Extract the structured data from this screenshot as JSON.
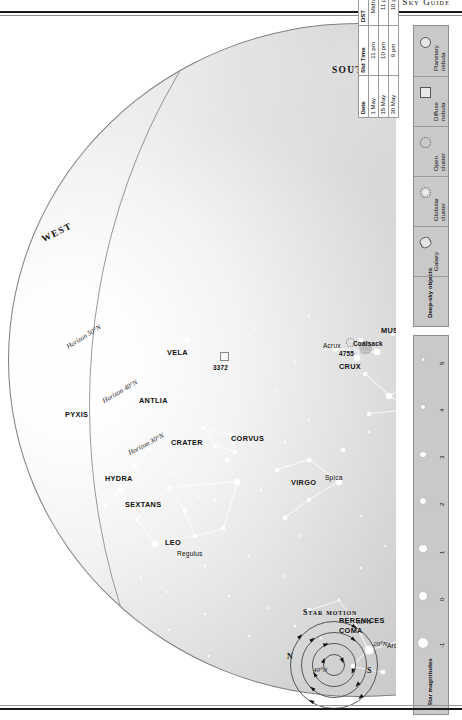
{
  "header": {
    "title": "Monthly Sky Guide"
  },
  "chart": {
    "cardinals": [
      {
        "label": "WEST",
        "x": 238,
        "y": 48,
        "rot": 118
      },
      {
        "label": "SOUTH",
        "x": 400,
        "y": 352,
        "rot": 90
      },
      {
        "label": "EAST",
        "x": 246,
        "y": 672,
        "rot": 64
      }
    ],
    "horizon_lines": [
      {
        "label": "Horizon 30°N"
      },
      {
        "label": "Horizon 40°N"
      },
      {
        "label": "Horizon 50°N"
      }
    ],
    "zenith_marks": [
      "40°N",
      "30°N",
      "20°N"
    ],
    "ecliptic_label": "Ecliptic",
    "constellations": [
      "PYXIS",
      "ANTLIA",
      "VELA",
      "CRATER",
      "CORVUS",
      "HYDRA",
      "SEXTANS",
      "LEO",
      "COMA BERENICES",
      "VIRGO",
      "BOOTES",
      "CORONA BOREALIS",
      "HERCULES",
      "SERPENS CAPUT",
      "OPHIUCHUS",
      "SERPENS CAUDA",
      "SCUTUM",
      "AQUILA",
      "SAGITTARIUS",
      "SCORPIUS",
      "LIBRA",
      "LUPUS",
      "NORMA",
      "ARA",
      "CIRCINUS",
      "CENTAURUS",
      "CRUX",
      "MUSCA"
    ],
    "named_stars": [
      "Regulus",
      "Spica",
      "Arcturus",
      "Antares",
      "Alpha Centauri",
      "Beta Centauri",
      "Acrux"
    ],
    "deep_sky_labels": [
      "3372",
      "5139",
      "4755",
      "Coalsack",
      "M8",
      "M22",
      "M6",
      "M7"
    ]
  },
  "table": {
    "columns": [
      "Date",
      "Std Time",
      "DST"
    ],
    "rows": [
      [
        "1 May",
        "11 pm",
        "Midnight"
      ],
      [
        "15 May",
        "10 pm",
        "11 pm"
      ],
      [
        "30 May",
        "9 pm",
        "10 pm"
      ]
    ]
  },
  "legend": {
    "dso_title": "Deep-sky objects",
    "dso_items": [
      {
        "label": "Galaxy",
        "icon": "galaxy-ellipse-icon"
      },
      {
        "label": "Globular cluster",
        "icon": "globular-cluster-icon"
      },
      {
        "label": "Open cluster",
        "icon": "open-cluster-icon"
      },
      {
        "label": "Diffuse nebula",
        "icon": "diffuse-nebula-icon"
      },
      {
        "label": "Planetary nebula",
        "icon": "planetary-nebula-icon"
      }
    ],
    "mag_title": "Star magnitudes",
    "magnitudes": [
      "-1",
      "0",
      "1",
      "2",
      "3",
      "4",
      "5"
    ]
  },
  "star_motion": {
    "title": "Star motion",
    "north_label": "N",
    "south_label": "S"
  }
}
